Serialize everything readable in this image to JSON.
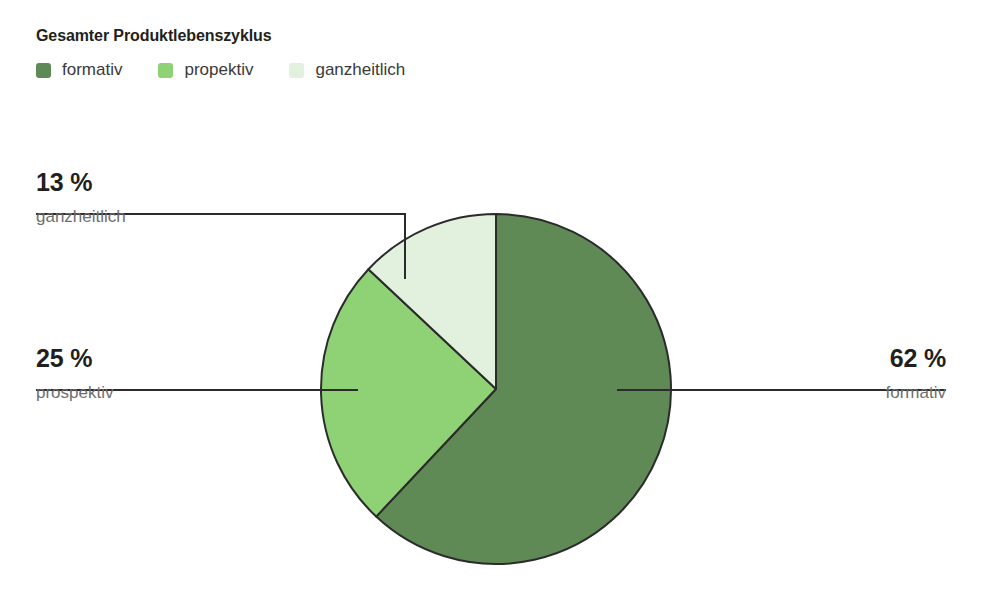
{
  "header": {
    "title": "Gesamter Produktlebenszyklus"
  },
  "legend": {
    "items": [
      {
        "label": "formativ",
        "color": "#5f8a55"
      },
      {
        "label": "propektiv",
        "color": "#8ed275"
      },
      {
        "label": "ganzheitlich",
        "color": "#e2f0de"
      }
    ]
  },
  "callouts": [
    {
      "id": "ganzheitlich",
      "value": "13 %",
      "name": "ganzheitlich"
    },
    {
      "id": "prospektiv",
      "value": "25 %",
      "name": "prospektiv"
    },
    {
      "id": "formativ",
      "value": "62 %",
      "name": "formativ"
    }
  ],
  "colors": {
    "formativ": "#5f8a55",
    "propektiv": "#8ed275",
    "ganzheitlich": "#e2f0de",
    "slice_stroke": "#2b2b2b",
    "leader_line": "#2b2b2b",
    "value_text": "#231f20",
    "name_text": "#6e6e6e",
    "background": "#ffffff"
  },
  "chart_data": {
    "type": "pie",
    "title": "Gesamter Produktlebenszyklus",
    "subtitle": "",
    "xlabel": "",
    "ylabel": "",
    "unit": "%",
    "grid": false,
    "legend_position": "top",
    "start_angle_deg": 0,
    "direction": "clockwise",
    "labels": [
      "formativ",
      "propektiv",
      "ganzheitlich"
    ],
    "values": [
      62,
      25,
      13
    ],
    "value_labels": [
      "62 %",
      "25 %",
      "13 %"
    ],
    "callout_labels": [
      "formativ",
      "prospektiv",
      "ganzheitlich"
    ],
    "colors": [
      "#5f8a55",
      "#8ed275",
      "#e2f0de"
    ],
    "slices": [
      {
        "label": "formativ",
        "callout_label": "formativ",
        "value": 62,
        "value_label": "62 %",
        "color": "#5f8a55",
        "start_deg": 0,
        "end_deg": 223.2
      },
      {
        "label": "propektiv",
        "callout_label": "prospektiv",
        "value": 25,
        "value_label": "25 %",
        "color": "#8ed275",
        "start_deg": 223.2,
        "end_deg": 313.2
      },
      {
        "label": "ganzheitlich",
        "callout_label": "ganzheitlich",
        "value": 13,
        "value_label": "13 %",
        "color": "#e2f0de",
        "start_deg": 313.2,
        "end_deg": 360
      }
    ],
    "total": 100
  }
}
